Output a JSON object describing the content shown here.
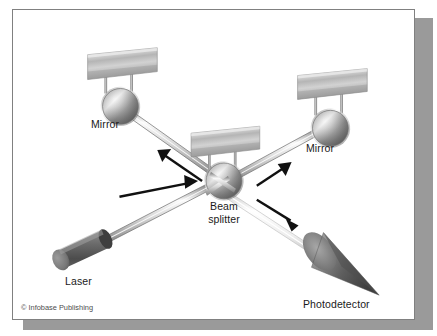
{
  "figure": {
    "background_color": "#ffffff",
    "frame_border_color": "#808080",
    "shadow_color": "#9a9a9a",
    "credit": "© Infobase Publishing"
  },
  "labels": {
    "mirror_left": "Mirror",
    "mirror_right": "Mirror",
    "beam_splitter_line1": "Beam",
    "beam_splitter_line2": "splitter",
    "laser": "Laser",
    "photodetector": "Photodetector"
  },
  "components": [
    {
      "name": "laser",
      "label": "Laser",
      "type": "cylinder",
      "color_light": "#8c8c8c",
      "color_dark": "#4f4f4f"
    },
    {
      "name": "mirror-left",
      "label": "Mirror",
      "type": "plate-on-posts",
      "color_light": "#d5d5d5",
      "color_dark": "#8a8a8a"
    },
    {
      "name": "beam-splitter",
      "label": "Beam splitter",
      "type": "plate-on-posts",
      "color_light": "#d5d5d5",
      "color_dark": "#8a8a8a"
    },
    {
      "name": "mirror-right",
      "label": "Mirror",
      "type": "plate-on-posts",
      "color_light": "#d5d5d5",
      "color_dark": "#8a8a8a"
    },
    {
      "name": "photodetector",
      "label": "Photodetector",
      "type": "cone",
      "color_light": "#9a9a9a",
      "color_dark": "#4a4a4a"
    }
  ],
  "beams": [
    {
      "name": "laser-to-splitter",
      "from": "laser",
      "to": "beam-splitter"
    },
    {
      "name": "splitter-to-mirror-left",
      "from": "beam-splitter",
      "to": "mirror-left"
    },
    {
      "name": "splitter-to-mirror-right",
      "from": "beam-splitter",
      "to": "mirror-right"
    },
    {
      "name": "splitter-to-photodetector",
      "from": "beam-splitter",
      "to": "photodetector"
    }
  ],
  "arrows": [
    {
      "name": "arrow-laser-to-splitter",
      "direction": "right"
    },
    {
      "name": "arrow-splitter-to-mirror-left",
      "direction": "up-left"
    },
    {
      "name": "arrow-splitter-to-mirror-right",
      "direction": "up-right"
    },
    {
      "name": "arrow-splitter-to-photodetector",
      "direction": "down-right"
    }
  ],
  "colors": {
    "metal_light": "#e2e2e2",
    "metal_mid": "#b3b3b3",
    "metal_dark": "#7a7a7a",
    "arrow": "#111111",
    "text": "#1a1a1a"
  }
}
